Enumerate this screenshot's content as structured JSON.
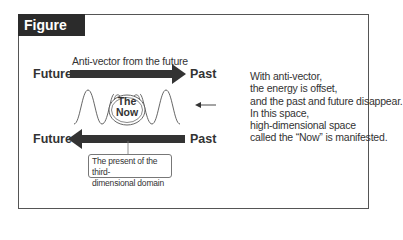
{
  "figure": {
    "title": "Figure 14",
    "top_arrow": {
      "left_label": "Future",
      "right_label": "Past",
      "caption": "Anti-vector from the future",
      "direction": "right"
    },
    "bottom_arrow": {
      "left_label": "Future",
      "right_label": "Past",
      "direction": "left"
    },
    "center": {
      "line1": "The",
      "line2": "Now"
    },
    "callout": {
      "line1": "The present of the third-",
      "line2": "dimensional domain"
    },
    "note": {
      "lines": [
        "With anti-vector,",
        "the energy is offset,",
        "and the past and future disappear.",
        "In this space,",
        "high-dimensional space",
        "called the “Now” is manifested."
      ]
    },
    "colors": {
      "arrow": "#333333",
      "frame": "#555555",
      "tab_bg": "#2b2b2b",
      "tab_text": "#ffffff"
    }
  }
}
